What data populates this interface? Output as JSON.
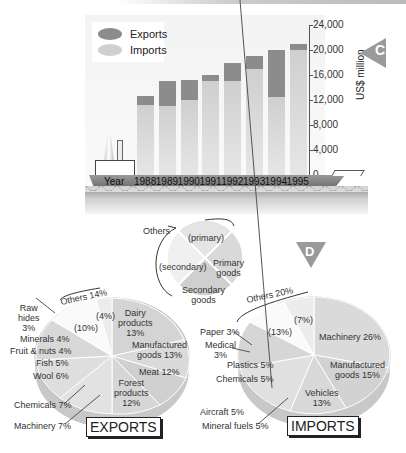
{
  "chart_data": [
    {
      "type": "bar",
      "stacked": true,
      "badge": "C",
      "categories": [
        "1988",
        "1989",
        "1990",
        "1991",
        "1992",
        "1993",
        "1994",
        "1995"
      ],
      "series": [
        {
          "name": "Imports",
          "values": [
            11200,
            11000,
            12000,
            15000,
            15000,
            17000,
            12500,
            20000
          ],
          "color": "#d8d8d8"
        },
        {
          "name": "Exports",
          "values": [
            1500,
            4000,
            3200,
            1000,
            3000,
            2000,
            7500,
            1000
          ],
          "color": "#8c8c8c"
        }
      ],
      "xlabel": "Year",
      "ylabel": "US$ million",
      "ylim": [
        0,
        24000
      ],
      "yticks": [
        "24,000",
        "20,000",
        "16,000",
        "12,000",
        "8,000",
        "4,000",
        "0"
      ],
      "legend": [
        "Exports",
        "Imports"
      ],
      "legend_position": "top-left"
    },
    {
      "type": "pie",
      "title": "Key",
      "slices": [
        {
          "label": "Others (primary)"
        },
        {
          "label": "Primary goods"
        },
        {
          "label": "Secondary goods"
        },
        {
          "label": "Others (secondary)"
        }
      ],
      "annotations": [
        "Others",
        "(primary)",
        "(secondary)",
        "Primary goods",
        "Secondary goods"
      ]
    },
    {
      "type": "pie",
      "title": "EXPORTS",
      "badge": "D",
      "slices": [
        {
          "label": "Dairy products",
          "value": 13
        },
        {
          "label": "Manufactured goods",
          "value": 13
        },
        {
          "label": "Meat",
          "value": 12
        },
        {
          "label": "Forest products",
          "value": 12
        },
        {
          "label": "Machinery",
          "value": 7
        },
        {
          "label": "Chemicals",
          "value": 7
        },
        {
          "label": "Wool",
          "value": 6
        },
        {
          "label": "Fish",
          "value": 5
        },
        {
          "label": "Fruit & nuts",
          "value": 4
        },
        {
          "label": "Minerals",
          "value": 4
        },
        {
          "label": "Raw hides",
          "value": 3
        },
        {
          "label": "Others (secondary)",
          "value": 10
        },
        {
          "label": "Others (primary)",
          "value": 4
        }
      ],
      "group_annotation": "Others 14%"
    },
    {
      "type": "pie",
      "title": "IMPORTS",
      "slices": [
        {
          "label": "Machinery",
          "value": 26
        },
        {
          "label": "Manufactured goods",
          "value": 15
        },
        {
          "label": "Vehicles",
          "value": 13
        },
        {
          "label": "Mineral fuels",
          "value": 5
        },
        {
          "label": "Aircraft",
          "value": 5
        },
        {
          "label": "Chemicals",
          "value": 5
        },
        {
          "label": "Plastics",
          "value": 5
        },
        {
          "label": "Medical",
          "value": 3
        },
        {
          "label": "Paper",
          "value": 3
        },
        {
          "label": "Others (secondary)",
          "value": 13
        },
        {
          "label": "Others (primary)",
          "value": 7
        }
      ],
      "group_annotation": "Others 20%"
    }
  ],
  "bar": {
    "legend": {
      "exports": "Exports",
      "imports": "Imports"
    },
    "badge": "C",
    "ylabel": "US$ million",
    "xlabel": "Year",
    "yticks": [
      "24,000",
      "20,000",
      "16,000",
      "12,000",
      "8,000",
      "4,000",
      "0"
    ],
    "years": [
      "1988",
      "1989",
      "1990",
      "1991",
      "1992",
      "1993",
      "1994",
      "1995"
    ]
  },
  "key": {
    "others": "Others",
    "primary_paren": "(primary)",
    "secondary_paren": "(secondary)",
    "primary_goods_1": "Primary",
    "primary_goods_2": "goods",
    "secondary_goods_1": "Secondary",
    "secondary_goods_2": "goods"
  },
  "exports": {
    "title": "EXPORTS",
    "others": "Others 14%",
    "p4": "(4%)",
    "p10": "(10%)",
    "dairy_1": "Dairy",
    "dairy_2": "products",
    "dairy_3": "13%",
    "manuf_1": "Manufactured",
    "manuf_2": "goods 13%",
    "meat": "Meat 12%",
    "forest_1": "Forest",
    "forest_2": "products",
    "forest_3": "12%",
    "raw_1": "Raw",
    "raw_2": "hides",
    "raw_3": "3%",
    "minerals": "Minerals 4%",
    "fruit": "Fruit & nuts 4%",
    "fish": "Fish 5%",
    "wool": "Wool 6%",
    "chemicals": "Chemicals 7%",
    "machinery": "Machinery 7%"
  },
  "imports": {
    "badge": "D",
    "title": "IMPORTS",
    "others": "Others 20%",
    "p7": "(7%)",
    "p13": "(13%)",
    "machinery": "Machinery 26%",
    "manuf_1": "Manufactured",
    "manuf_2": "goods 15%",
    "vehicles_1": "Vehicles",
    "vehicles_2": "13%",
    "paper": "Paper 3%",
    "medical_1": "Medical",
    "medical_2": "3%",
    "plastics": "Plastics 5%",
    "chemicals": "Chemicals 5%",
    "aircraft": "Aircraft 5%",
    "fuels": "Mineral fuels 5%"
  }
}
